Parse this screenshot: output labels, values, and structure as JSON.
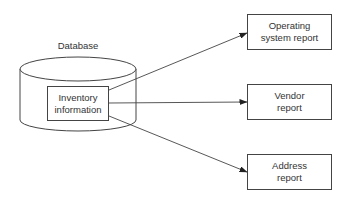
{
  "diagram": {
    "database": {
      "label": "Database",
      "inner_box": {
        "line1": "Inventory",
        "line2": "information"
      }
    },
    "reports": [
      {
        "line1": "Operating",
        "line2": "system report"
      },
      {
        "line1": "Vendor",
        "line2": "report"
      },
      {
        "line1": "Address",
        "line2": "report"
      }
    ],
    "edges": [
      {
        "from": "Inventory information",
        "to": "Operating system report"
      },
      {
        "from": "Inventory information",
        "to": "Vendor report"
      },
      {
        "from": "Inventory information",
        "to": "Address report"
      }
    ],
    "colors": {
      "stroke": "#444444",
      "text": "#333333",
      "background": "#ffffff"
    }
  }
}
